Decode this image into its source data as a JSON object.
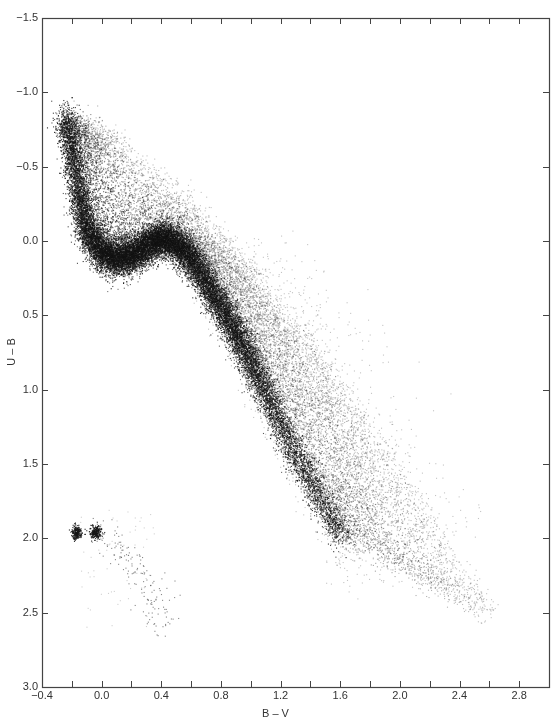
{
  "chart_data": {
    "type": "scatter",
    "title": "",
    "xlabel": "B – V",
    "ylabel": "U – B",
    "xlim": [
      -0.4,
      3.0
    ],
    "ylim": [
      -1.5,
      3.0
    ],
    "y_inverted": true,
    "grid": false,
    "legend": null,
    "x_ticks": [
      -0.4,
      -0.2,
      0.0,
      0.2,
      0.4,
      0.6,
      0.8,
      1.0,
      1.2,
      1.4,
      1.6,
      1.8,
      2.0,
      2.2,
      2.4,
      2.6,
      2.8
    ],
    "x_tick_labels": [
      {
        "value": -0.4,
        "label": "−0.4"
      },
      {
        "value": 0.0,
        "label": "0.0"
      },
      {
        "value": 0.4,
        "label": "0.4"
      },
      {
        "value": 0.8,
        "label": "0.8"
      },
      {
        "value": 1.2,
        "label": "1.2"
      },
      {
        "value": 1.6,
        "label": "1.6"
      },
      {
        "value": 2.0,
        "label": "2.0"
      },
      {
        "value": 2.4,
        "label": "2.4"
      },
      {
        "value": 2.8,
        "label": "2.8"
      }
    ],
    "y_tick_labels": [
      {
        "value": -1.5,
        "label": "−1.5"
      },
      {
        "value": -1.0,
        "label": "−1.0"
      },
      {
        "value": -0.5,
        "label": "−0.5"
      },
      {
        "value": 0.0,
        "label": "0.0"
      },
      {
        "value": 0.5,
        "label": "0.5"
      },
      {
        "value": 1.0,
        "label": "1.0"
      },
      {
        "value": 1.5,
        "label": "1.5"
      },
      {
        "value": 2.0,
        "label": "2.0"
      },
      {
        "value": 2.5,
        "label": "2.5"
      },
      {
        "value": 3.0,
        "label": "3.0"
      }
    ],
    "series": [
      {
        "name": "main-sequence-ridge",
        "description": "dense stellar locus (dwarf sequence), B–V vs U–B",
        "points": [
          {
            "x": -0.25,
            "y": -0.85,
            "density": 0.5
          },
          {
            "x": -0.2,
            "y": -0.6,
            "density": 0.6
          },
          {
            "x": -0.15,
            "y": -0.3,
            "density": 0.7
          },
          {
            "x": -0.1,
            "y": -0.05,
            "density": 0.9
          },
          {
            "x": 0.0,
            "y": 0.08,
            "density": 1.0
          },
          {
            "x": 0.1,
            "y": 0.12,
            "density": 1.0
          },
          {
            "x": 0.2,
            "y": 0.1,
            "density": 0.9
          },
          {
            "x": 0.3,
            "y": 0.03,
            "density": 0.9
          },
          {
            "x": 0.4,
            "y": -0.02,
            "density": 1.0
          },
          {
            "x": 0.5,
            "y": 0.02,
            "density": 1.0
          },
          {
            "x": 0.6,
            "y": 0.12,
            "density": 0.9
          },
          {
            "x": 0.7,
            "y": 0.28,
            "density": 0.8
          },
          {
            "x": 0.8,
            "y": 0.45,
            "density": 0.8
          },
          {
            "x": 0.9,
            "y": 0.62,
            "density": 0.8
          },
          {
            "x": 1.0,
            "y": 0.82,
            "density": 0.7
          },
          {
            "x": 1.1,
            "y": 1.02,
            "density": 0.55
          },
          {
            "x": 1.2,
            "y": 1.25,
            "density": 0.4
          },
          {
            "x": 1.3,
            "y": 1.45,
            "density": 0.3
          },
          {
            "x": 1.4,
            "y": 1.62,
            "density": 0.25
          },
          {
            "x": 1.5,
            "y": 1.8,
            "density": 0.25
          },
          {
            "x": 1.6,
            "y": 1.97,
            "density": 0.3
          }
        ]
      },
      {
        "name": "upper-envelope-scatter",
        "description": "reddened / sparse field stars above the locus",
        "points": [
          {
            "x": -0.1,
            "y": -0.75
          },
          {
            "x": 0.1,
            "y": -0.7
          },
          {
            "x": 0.3,
            "y": -0.5
          },
          {
            "x": 0.5,
            "y": -0.35
          },
          {
            "x": 0.7,
            "y": -0.15
          },
          {
            "x": 0.9,
            "y": 0.1
          },
          {
            "x": 1.1,
            "y": 0.35
          },
          {
            "x": 1.4,
            "y": 0.7
          },
          {
            "x": 1.7,
            "y": 1.1
          },
          {
            "x": 2.0,
            "y": 1.5
          },
          {
            "x": 2.3,
            "y": 2.0
          },
          {
            "x": 2.6,
            "y": 2.5
          }
        ]
      },
      {
        "name": "white-dwarf-group",
        "description": "two compact clumps plus sparse tail, lower left",
        "points": [
          {
            "x": -0.17,
            "y": 1.96,
            "density": 1.0
          },
          {
            "x": -0.04,
            "y": 1.96,
            "density": 1.0
          },
          {
            "x": 0.1,
            "y": 2.05,
            "density": 0.3
          },
          {
            "x": 0.2,
            "y": 2.15,
            "density": 0.3
          },
          {
            "x": 0.3,
            "y": 2.3,
            "density": 0.3
          },
          {
            "x": 0.35,
            "y": 2.45,
            "density": 0.3
          },
          {
            "x": 0.4,
            "y": 2.6,
            "density": 0.3
          }
        ]
      }
    ]
  },
  "layout": {
    "plot_left": 42,
    "plot_right": 549,
    "plot_top": 18,
    "plot_bottom": 687,
    "ink_color": "#1a1a1a",
    "axis_color": "#444444"
  }
}
